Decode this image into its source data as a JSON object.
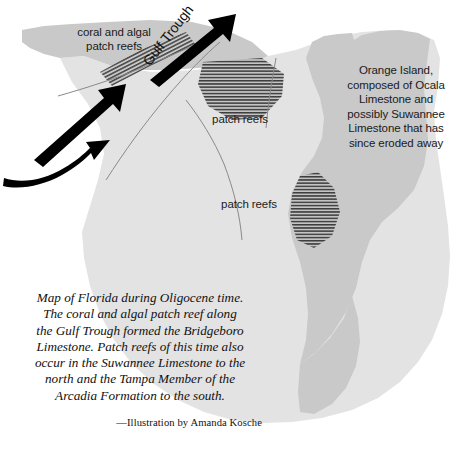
{
  "figure": {
    "type": "paleogeographic-map",
    "region": "Florida",
    "epoch": "Oligocene"
  },
  "colors": {
    "background": "#ffffff",
    "shelf": "#e3e3e3",
    "landmass": "#c9c9c9",
    "reef_hatch": "#4a4a4a",
    "reef_fill": "#c0c0c0",
    "boundary_line": "#8a8a8a",
    "arrow": "#000000",
    "label_text": "#1a1a1a",
    "caption_text": "#111111"
  },
  "map_labels": {
    "coral_algal": "coral and algal\npatch reefs",
    "gulf_trough": "Gulf Trough",
    "patch_reefs_upper": "patch reefs",
    "patch_reefs_lower": "patch reefs",
    "orange_island": "Orange Island,\ncomposed of Ocala\nLimestone and\npossibly Suwannee\nLimestone that has\nsince eroded away"
  },
  "caption": {
    "body": "Map of Florida during Oligocene time. The coral and algal patch reef along the Gulf Trough formed the Bridgeboro Limestone. Patch reefs of this time also occur in the Suwannee Limestone to the north and the Tampa Member of the Arcadia Formation to the south.",
    "credit": "—Illustration by Amanda Kosche"
  },
  "icons": {
    "flow_arrow_lower_left": "curved-arrow-icon",
    "flow_arrow_middle": "straight-arrow-icon",
    "flow_arrow_upper": "straight-arrow-icon"
  }
}
